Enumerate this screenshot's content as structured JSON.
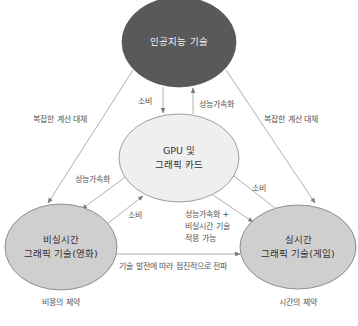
{
  "nodes": {
    "ai": {
      "label": "인공지능 기술",
      "fill": "#595959"
    },
    "gpu": {
      "line1": "GPU 및",
      "line2": "그래픽 카드",
      "fill": "#efefef"
    },
    "offline": {
      "line1": "비실시간",
      "line2": "그래픽 기술(영화)",
      "fill": "#cfcfcf",
      "caption": "비용의 제약"
    },
    "realtime": {
      "line1": "실시간",
      "line2": "그래픽 기술(게임)",
      "fill": "#cfcfcf",
      "caption": "시간의 제약"
    }
  },
  "edges": {
    "ai_to_offline": "복잡한 계산 대체",
    "ai_to_realtime": "복잡한 계산 대체",
    "ai_to_gpu": "소비",
    "gpu_to_ai": "성능가속화",
    "gpu_to_offline": "성능가속화",
    "offline_to_gpu": "소비",
    "gpu_to_realtime_line1": "성능가속화 +",
    "gpu_to_realtime_line2": "비실시간 기술",
    "gpu_to_realtime_line3": "적용 가능",
    "realtime_to_gpu": "소비",
    "offline_to_realtime": "기술 발전에 따라 점진적으로 전파"
  },
  "colors": {
    "line": "#8a8a8a",
    "arrow": "#7a7a7a"
  }
}
